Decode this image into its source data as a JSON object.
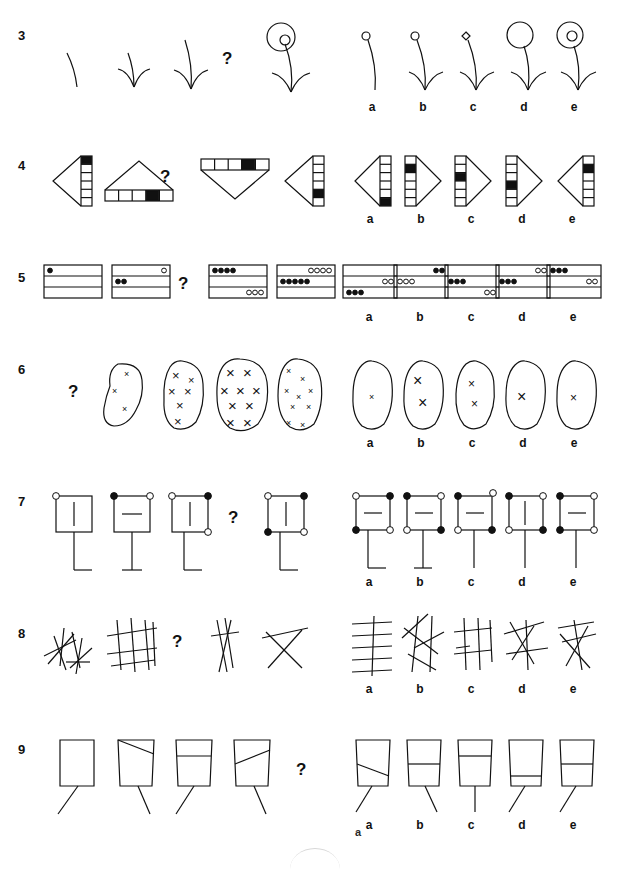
{
  "page": {
    "kind": "non-verbal-reasoning-test",
    "background": "#ffffff",
    "ink": "#111111",
    "footer_mark": "a",
    "width": 629,
    "height": 858
  },
  "option_labels": [
    "a",
    "b",
    "c",
    "d",
    "e"
  ],
  "question_mark": "?",
  "rows": [
    {
      "number": "3",
      "type": "plant-stem-with-bud",
      "question_mark_position": "index-3",
      "prompt_description": "Sequence of curved stems gaining leaf pairs then a spiral bud",
      "prompt_figures": [
        {
          "name": "stem-no-leaves-no-bud",
          "leaves": 0,
          "bud": "none",
          "stem": "short-curve"
        },
        {
          "name": "stem-two-leaves-no-bud",
          "leaves": 2,
          "bud": "none",
          "stem": "short-curve"
        },
        {
          "name": "stem-two-leaves-tall",
          "leaves": 2,
          "bud": "none",
          "stem": "tall-curve"
        },
        {
          "name": "stem-spiral-bud-large",
          "leaves": 2,
          "bud": "spiral-large",
          "stem": "tall-curve"
        }
      ],
      "options": [
        {
          "label": "a",
          "leaves": 0,
          "bud": "small-circle",
          "stem": "tall-curve"
        },
        {
          "label": "b",
          "leaves": 2,
          "bud": "small-circle",
          "stem": "tall-curve"
        },
        {
          "label": "c",
          "leaves": 2,
          "bud": "small-diamond",
          "stem": "tall-curve"
        },
        {
          "label": "d",
          "leaves": 2,
          "bud": "large-circle",
          "stem": "tall-curve"
        },
        {
          "label": "e",
          "leaves": 2,
          "bud": "circle-with-inner-circle",
          "stem": "tall-curve"
        }
      ]
    },
    {
      "number": "4",
      "type": "triangle-with-segmented-bar",
      "question_mark_position": "index-2",
      "prompt_description": "Triangles attached to a six-cell bar with one black cell",
      "prompt_figures": [
        {
          "name": "triangle-left-bar-right",
          "direction": "left",
          "bar": "vertical-right",
          "cells": 6,
          "filled_index": 0
        },
        {
          "name": "triangle-up-bar-bottom",
          "direction": "up",
          "bar": "horizontal-bottom",
          "cells": 5,
          "filled_index": 4
        },
        {
          "name": "triangle-down-bar-top",
          "direction": "down",
          "bar": "horizontal-top",
          "cells": 6,
          "filled_index": 3
        },
        {
          "name": "triangle-left-bar-right-low",
          "direction": "left",
          "bar": "vertical-right",
          "cells": 6,
          "filled_index": 4
        }
      ],
      "options": [
        {
          "label": "a",
          "direction": "left",
          "bar": "vertical-right",
          "cells": 6,
          "filled_index": 5
        },
        {
          "label": "b",
          "direction": "right",
          "bar": "vertical-left",
          "cells": 6,
          "filled_index": 1
        },
        {
          "label": "c",
          "direction": "right",
          "bar": "vertical-left",
          "cells": 6,
          "filled_index": 2
        },
        {
          "label": "d",
          "direction": "right",
          "bar": "vertical-left",
          "cells": 6,
          "filled_index": 3
        },
        {
          "label": "e",
          "direction": "left",
          "bar": "vertical-right",
          "cells": 6,
          "filled_index": 1
        }
      ]
    },
    {
      "number": "5",
      "type": "three-band-rectangle-with-dots",
      "question_mark_position": "index-2",
      "prompt_description": "Rectangles split into three bands containing black or white dots",
      "prompt_figures": [
        {
          "name": "rect-one-black-top",
          "bands": [
            {
              "dots": 1,
              "fill": "black",
              "side": "left"
            },
            {
              "dots": 0,
              "fill": "none",
              "side": "left"
            },
            {
              "dots": 0,
              "fill": "none",
              "side": "left"
            }
          ]
        },
        {
          "name": "rect-white-top-right-black-mid",
          "bands": [
            {
              "dots": 1,
              "fill": "white",
              "side": "right"
            },
            {
              "dots": 2,
              "fill": "black",
              "side": "left"
            },
            {
              "dots": 0,
              "fill": "none",
              "side": "left"
            }
          ]
        },
        {
          "name": "rect-four-black-top-three-white-bottom",
          "bands": [
            {
              "dots": 4,
              "fill": "black",
              "side": "left"
            },
            {
              "dots": 0,
              "fill": "none",
              "side": "left"
            },
            {
              "dots": 3,
              "fill": "white",
              "side": "right"
            }
          ]
        },
        {
          "name": "rect-four-white-top-five-black-mid",
          "bands": [
            {
              "dots": 4,
              "fill": "white",
              "side": "right"
            },
            {
              "dots": 5,
              "fill": "black",
              "side": "left"
            },
            {
              "dots": 0,
              "fill": "none",
              "side": "left"
            }
          ]
        }
      ],
      "options": [
        {
          "label": "a",
          "bands": [
            {
              "dots": 0,
              "fill": "none",
              "side": "left"
            },
            {
              "dots": 2,
              "fill": "white",
              "side": "right"
            },
            {
              "dots": 3,
              "fill": "black",
              "side": "left"
            }
          ]
        },
        {
          "label": "b",
          "bands": [
            {
              "dots": 2,
              "fill": "black",
              "side": "right"
            },
            {
              "dots": 3,
              "fill": "white",
              "side": "left"
            },
            {
              "dots": 0,
              "fill": "none",
              "side": "left"
            }
          ]
        },
        {
          "label": "c",
          "bands": [
            {
              "dots": 0,
              "fill": "none",
              "side": "left"
            },
            {
              "dots": 3,
              "fill": "black",
              "side": "left"
            },
            {
              "dots": 2,
              "fill": "white",
              "side": "right"
            }
          ]
        },
        {
          "label": "d",
          "bands": [
            {
              "dots": 2,
              "fill": "white",
              "side": "right"
            },
            {
              "dots": 3,
              "fill": "black",
              "side": "left"
            },
            {
              "dots": 0,
              "fill": "none",
              "side": "left"
            }
          ]
        },
        {
          "label": "e",
          "bands": [
            {
              "dots": 3,
              "fill": "black",
              "side": "left"
            },
            {
              "dots": 2,
              "fill": "white",
              "side": "right"
            },
            {
              "dots": 0,
              "fill": "none",
              "side": "left"
            }
          ]
        }
      ]
    },
    {
      "number": "6",
      "type": "blob-with-x-marks",
      "question_mark_position": "index-0",
      "prompt_description": "Irregular blobs containing varying numbers and sizes of X marks",
      "prompt_figures": [
        {
          "name": "blob-three-small-x",
          "marks": 3,
          "size": "small"
        },
        {
          "name": "blob-six-medium-x",
          "marks": 6,
          "size": "medium"
        },
        {
          "name": "blob-nine-large-x",
          "marks": 9,
          "size": "large"
        },
        {
          "name": "blob-nine-small-x",
          "marks": 9,
          "size": "small"
        }
      ],
      "options": [
        {
          "label": "a",
          "marks": 1,
          "size": "small"
        },
        {
          "label": "b",
          "marks": 2,
          "size": "large"
        },
        {
          "label": "c",
          "marks": 2,
          "size": "medium"
        },
        {
          "label": "d",
          "marks": 1,
          "size": "large"
        },
        {
          "label": "e",
          "marks": 1,
          "size": "medium"
        }
      ]
    },
    {
      "number": "7",
      "type": "square-with-corner-dots-and-stem",
      "question_mark_position": "index-3",
      "prompt_description": "Squares with four corner dots, an inner bar and a stem with a foot",
      "prompt_figures": [
        {
          "name": "square-one-hollow-vertical-bar",
          "corners": [
            "hollow",
            "none",
            "none",
            "none"
          ],
          "inner": "vertical",
          "foot": "right"
        },
        {
          "name": "square-two-top-dots-horizontal-bar",
          "corners": [
            "filled",
            "hollow",
            "none",
            "none"
          ],
          "inner": "horizontal",
          "foot": "both"
        },
        {
          "name": "square-three-dots-vertical-bar",
          "corners": [
            "hollow",
            "filled",
            "none",
            "hollow"
          ],
          "inner": "vertical",
          "foot": "right"
        },
        {
          "name": "square-four-dots-vertical-bar",
          "corners": [
            "hollow",
            "filled",
            "filled",
            "hollow"
          ],
          "inner": "vertical",
          "foot": "right"
        }
      ],
      "options": [
        {
          "label": "a",
          "corners": [
            "hollow",
            "filled",
            "filled",
            "hollow"
          ],
          "inner": "horizontal",
          "foot": "right"
        },
        {
          "label": "b",
          "corners": [
            "filled",
            "hollow",
            "hollow",
            "filled"
          ],
          "inner": "horizontal",
          "foot": "both"
        },
        {
          "label": "c",
          "corners": [
            "filled",
            "hollow",
            "hollow",
            "filled"
          ],
          "inner": "horizontal",
          "foot": "none"
        },
        {
          "label": "d",
          "corners": [
            "filled",
            "hollow",
            "hollow",
            "filled"
          ],
          "inner": "vertical",
          "foot": "none"
        },
        {
          "label": "e",
          "corners": [
            "filled",
            "hollow",
            "filled",
            "hollow"
          ],
          "inner": "horizontal",
          "foot": "none"
        }
      ]
    },
    {
      "number": "8",
      "type": "crossing-line-cluster",
      "question_mark_position": "index-1",
      "prompt_description": "Clusters of straight crossing lines of varying counts and orientations",
      "prompt_figures": [
        {
          "name": "cluster-dense-left",
          "lines": 8,
          "style": "scattered"
        },
        {
          "name": "cluster-grid-right",
          "lines": 7,
          "style": "grid"
        },
        {
          "name": "cluster-sparse-vertical",
          "lines": 4,
          "style": "vertical-pair"
        },
        {
          "name": "cluster-x-shape",
          "lines": 3,
          "style": "x-shape"
        }
      ],
      "options": [
        {
          "label": "a",
          "lines": 5,
          "style": "horizontal-stack"
        },
        {
          "label": "b",
          "lines": 6,
          "style": "scattered-x"
        },
        {
          "label": "c",
          "lines": 6,
          "style": "hash-grid"
        },
        {
          "label": "d",
          "lines": 5,
          "style": "cross-diagonal"
        },
        {
          "label": "e",
          "lines": 5,
          "style": "star-cross"
        }
      ]
    },
    {
      "number": "9",
      "type": "trapezoid-with-bar-and-leg",
      "question_mark_position": "index-4",
      "prompt_description": "Trapezoid containers with a rising inner line and a diagonal leg",
      "prompt_figures": [
        {
          "name": "rect-empty-leg-left",
          "shape": "rectangle",
          "inner": "none",
          "leg": "left"
        },
        {
          "name": "trapezoid-diagonal-high",
          "shape": "trapezoid",
          "inner": "diagonal-high",
          "leg": "left"
        },
        {
          "name": "trapezoid-horizontal-high",
          "shape": "trapezoid",
          "inner": "horizontal-high",
          "leg": "left"
        },
        {
          "name": "trapezoid-diagonal-mid",
          "shape": "trapezoid",
          "inner": "diagonal-mid",
          "leg": "left"
        }
      ],
      "options": [
        {
          "label": "a",
          "shape": "trapezoid",
          "inner": "diagonal-low",
          "leg": "left"
        },
        {
          "label": "b",
          "shape": "trapezoid",
          "inner": "horizontal-mid",
          "leg": "left"
        },
        {
          "label": "c",
          "shape": "trapezoid",
          "inner": "horizontal-high",
          "leg": "center"
        },
        {
          "label": "d",
          "shape": "trapezoid",
          "inner": "horizontal-low",
          "leg": "left"
        },
        {
          "label": "e",
          "shape": "trapezoid",
          "inner": "horizontal-mid",
          "leg": "left"
        }
      ]
    }
  ]
}
